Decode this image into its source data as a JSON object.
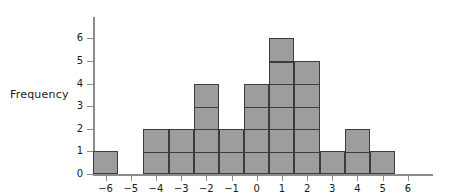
{
  "chart_data": {
    "type": "bar",
    "title": "",
    "subtitle": "",
    "xlabel": "",
    "ylabel": "Frequency",
    "categories": [
      "-6",
      "-5",
      "-4",
      "-3",
      "-2",
      "-1",
      "0",
      "1",
      "2",
      "3",
      "4",
      "5",
      "6"
    ],
    "values": [
      1,
      0,
      2,
      2,
      4,
      2,
      4,
      6,
      5,
      1,
      2,
      1,
      0
    ],
    "xticks": [
      "−6",
      "−5",
      "−4",
      "−3",
      "−2",
      "−1",
      "0",
      "1",
      "2",
      "3",
      "4",
      "5",
      "6"
    ],
    "yticks": [
      "0",
      "1",
      "2",
      "3",
      "4",
      "5",
      "6"
    ],
    "xlim": [
      -6.5,
      7.0
    ],
    "ylim": [
      0,
      6.4
    ],
    "grid": false,
    "legend": null,
    "bar_fill_color": "#9d9d9d",
    "bar_edge_color": "#3c3c3c",
    "axis_color": "#8c8c8c",
    "bin_width": 1,
    "bars_centered_on_ticks": true,
    "annotations": []
  },
  "axis": {
    "y_label": "Frequency"
  }
}
